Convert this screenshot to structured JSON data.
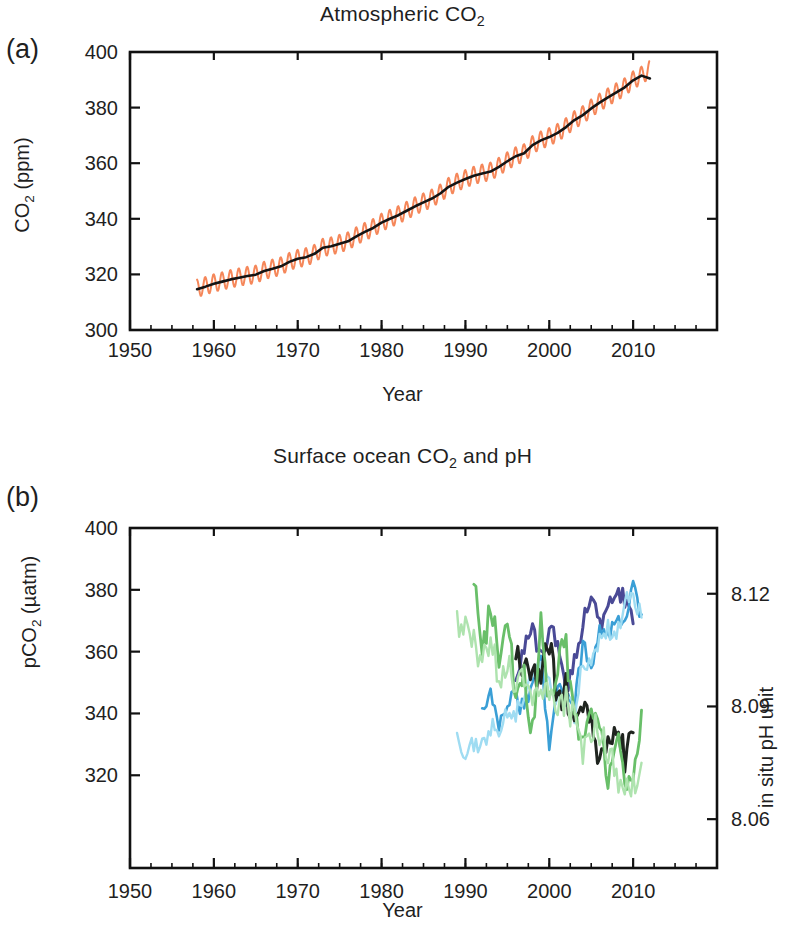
{
  "figure": {
    "width": 805,
    "height": 949,
    "background": "#ffffff"
  },
  "panel_a": {
    "letter": "(a)",
    "title_prefix": "Atmospheric CO",
    "title_sub": "2",
    "xlabel": "Year",
    "ylabel_prefix": "CO",
    "ylabel_sub": "2",
    "ylabel_suffix": " (ppm)"
  },
  "panel_b": {
    "letter": "(b)",
    "title_prefix": "Surface ocean CO",
    "title_sub": "2",
    "title_suffix": " and pH",
    "xlabel": "Year",
    "ylabel_prefix": "pCO",
    "ylabel_sub": "2",
    "ylabel_suffix": " (µatm)",
    "ylabel_right": "in situ pH unit"
  },
  "chart_data": [
    {
      "type": "line",
      "panel": "a",
      "title": "Atmospheric CO2",
      "xlabel": "Year",
      "ylabel": "CO2 (ppm)",
      "xlim": [
        1950,
        2020
      ],
      "ylim": [
        300,
        400
      ],
      "xticks": [
        1950,
        1960,
        1970,
        1980,
        1990,
        2000,
        2010
      ],
      "xticklabels": [
        "1950",
        "1960",
        "1970",
        "1980",
        "1990",
        "2000",
        "2010"
      ],
      "xminor_step": 2.5,
      "yticks": [
        300,
        320,
        340,
        360,
        380,
        400
      ],
      "yticklabels": [
        "300",
        "320",
        "340",
        "360",
        "380",
        "400"
      ],
      "grid": false,
      "legend": "none",
      "series": [
        {
          "name": "Mauna Loa monthly CO2 (seasonal cycle)",
          "color": "#f5875a",
          "linewidth": 2.0,
          "note": "monthly values with ~6 ppm peak-to-peak seasonal oscillation about the trend",
          "seasonal_amplitude_ppm": 3.2,
          "x": [
            1958,
            1959,
            1960,
            1961,
            1962,
            1963,
            1964,
            1965,
            1966,
            1967,
            1968,
            1969,
            1970,
            1971,
            1972,
            1973,
            1974,
            1975,
            1976,
            1977,
            1978,
            1979,
            1980,
            1981,
            1982,
            1983,
            1984,
            1985,
            1986,
            1987,
            1988,
            1989,
            1990,
            1991,
            1992,
            1993,
            1994,
            1995,
            1996,
            1997,
            1998,
            1999,
            2000,
            2001,
            2002,
            2003,
            2004,
            2005,
            2006,
            2007,
            2008,
            2009,
            2010,
            2011,
            2012
          ],
          "values": [
            315.0,
            315.9,
            316.9,
            317.6,
            318.4,
            319.0,
            319.6,
            320.0,
            321.4,
            322.2,
            323.0,
            324.6,
            325.7,
            326.3,
            327.5,
            329.7,
            330.2,
            331.1,
            332.0,
            333.8,
            335.4,
            336.8,
            338.7,
            340.1,
            341.4,
            343.0,
            344.6,
            346.0,
            347.4,
            349.2,
            351.6,
            353.1,
            354.4,
            355.6,
            356.4,
            357.1,
            358.8,
            360.8,
            362.6,
            363.7,
            366.6,
            368.3,
            369.5,
            371.0,
            373.1,
            375.6,
            377.4,
            379.8,
            381.9,
            383.8,
            385.6,
            387.4,
            389.9,
            391.6,
            393.8
          ]
        },
        {
          "name": "Mauna Loa deseasonalized trend CO2",
          "color": "#141414",
          "linewidth": 2.6,
          "x": [
            1958,
            1959,
            1960,
            1961,
            1962,
            1963,
            1964,
            1965,
            1966,
            1967,
            1968,
            1969,
            1970,
            1971,
            1972,
            1973,
            1974,
            1975,
            1976,
            1977,
            1978,
            1979,
            1980,
            1981,
            1982,
            1983,
            1984,
            1985,
            1986,
            1987,
            1988,
            1989,
            1990,
            1991,
            1992,
            1993,
            1994,
            1995,
            1996,
            1997,
            1998,
            1999,
            2000,
            2001,
            2002,
            2003,
            2004,
            2005,
            2006,
            2007,
            2008,
            2009,
            2010,
            2011,
            2012
          ],
          "values": [
            314.7,
            315.6,
            316.6,
            317.4,
            318.2,
            318.8,
            319.4,
            319.9,
            321.2,
            322.0,
            322.9,
            324.5,
            325.6,
            326.2,
            327.4,
            329.6,
            330.1,
            331.0,
            331.9,
            333.7,
            335.3,
            336.7,
            338.6,
            340.0,
            341.3,
            342.9,
            344.5,
            345.9,
            347.3,
            349.1,
            351.5,
            353.0,
            354.3,
            355.5,
            356.3,
            357.0,
            358.7,
            360.7,
            362.5,
            363.6,
            366.5,
            368.2,
            369.4,
            370.9,
            373.0,
            375.5,
            377.3,
            379.7,
            381.8,
            383.7,
            385.5,
            387.3,
            389.8,
            391.5,
            390.5
          ]
        }
      ]
    },
    {
      "type": "line",
      "panel": "b",
      "title": "Surface ocean CO2 and pH",
      "xlabel": "Year",
      "ylabel": "pCO2 (µatm)",
      "ylabel_right": "in situ pH unit",
      "xlim": [
        1950,
        2020
      ],
      "ylim": [
        290,
        400
      ],
      "ylim_right": [
        8.047,
        8.1375
      ],
      "xticks": [
        1950,
        1960,
        1970,
        1980,
        1990,
        2000,
        2010
      ],
      "xticklabels": [
        "1950",
        "1960",
        "1970",
        "1980",
        "1990",
        "2000",
        "2010"
      ],
      "xminor_step": 2.5,
      "yticks": [
        320,
        340,
        360,
        380,
        400
      ],
      "yticklabels": [
        "320",
        "340",
        "360",
        "380",
        "400"
      ],
      "yticks_right": [
        8.06,
        8.09,
        8.12
      ],
      "yticklabels_right": [
        "8.06",
        "8.09",
        "8.12"
      ],
      "grid": false,
      "legend": "none",
      "series": [
        {
          "name": "pCO2 station dark blue",
          "axis": "left",
          "color": "#4a4a96",
          "linewidth": 3.0,
          "x": [
            1996,
            1997,
            1998,
            1999,
            2000,
            2001,
            2002,
            2003,
            2004,
            2005,
            2006,
            2007,
            2008,
            2009,
            2010
          ],
          "values": [
            352,
            362,
            366,
            358,
            368,
            362,
            347,
            358,
            369,
            380,
            368,
            373,
            379,
            377,
            369
          ]
        },
        {
          "name": "pCO2 station medium blue",
          "axis": "left",
          "color": "#3a9fd6",
          "linewidth": 2.6,
          "x": [
            1992,
            1993,
            1994,
            1995,
            1996,
            1997,
            1998,
            1999,
            2000,
            2001,
            2002,
            2003,
            2004,
            2005,
            2006,
            2007,
            2008,
            2009,
            2010,
            2011
          ],
          "values": [
            341,
            346,
            337,
            344,
            345,
            341,
            352,
            357,
            330,
            351,
            344,
            343,
            362,
            356,
            366,
            364,
            370,
            369,
            381,
            372
          ]
        },
        {
          "name": "pCO2 station pale cyan",
          "axis": "left",
          "color": "#9fdcf2",
          "linewidth": 2.4,
          "x": [
            1989,
            1990,
            1991,
            1992,
            1993,
            1994,
            1995,
            1996,
            1997,
            1998,
            1999,
            2000,
            2001,
            2002,
            2003,
            2004,
            2005,
            2006,
            2007,
            2008,
            2009,
            2010,
            2011
          ],
          "values": [
            331,
            327,
            330,
            329,
            336,
            333,
            341,
            339,
            347,
            352,
            354,
            352,
            343,
            349,
            338,
            358,
            356,
            363,
            368,
            364,
            376,
            379,
            371
          ]
        },
        {
          "name": "pH station dark",
          "axis": "right",
          "color": "#1f241f",
          "linewidth": 3.0,
          "x": [
            1996,
            1997,
            1998,
            1999,
            2000,
            2001,
            2002,
            2003,
            2004,
            2005,
            2006,
            2007,
            2008,
            2009,
            2010
          ],
          "values": [
            8.105,
            8.099,
            8.1,
            8.098,
            8.108,
            8.09,
            8.095,
            8.083,
            8.093,
            8.086,
            8.076,
            8.079,
            8.086,
            8.077,
            8.083
          ]
        },
        {
          "name": "pH station medium green",
          "axis": "right",
          "color": "#69bf69",
          "linewidth": 2.8,
          "x": [
            1991,
            1992,
            1993,
            1994,
            1995,
            1996,
            1997,
            1998,
            1999,
            2000,
            2001,
            2002,
            2003,
            2004,
            2005,
            2006,
            2007,
            2008,
            2009,
            2010,
            2011
          ],
          "values": [
            8.122,
            8.105,
            8.117,
            8.103,
            8.113,
            8.094,
            8.097,
            8.083,
            8.113,
            8.091,
            8.102,
            8.105,
            8.089,
            8.082,
            8.088,
            8.086,
            8.072,
            8.082,
            8.071,
            8.071,
            8.089
          ]
        },
        {
          "name": "pH station pale green",
          "axis": "right",
          "color": "#aee3ae",
          "linewidth": 2.4,
          "x": [
            1989,
            1990,
            1991,
            1992,
            1993,
            1994,
            1995,
            1996,
            1997,
            1998,
            1999,
            2000,
            2001,
            2002,
            2003,
            2004,
            2005,
            2006,
            2007,
            2008,
            2009,
            2010,
            2011
          ],
          "values": [
            8.112,
            8.11,
            8.107,
            8.1,
            8.108,
            8.096,
            8.102,
            8.093,
            8.098,
            8.089,
            8.096,
            8.094,
            8.088,
            8.092,
            8.086,
            8.079,
            8.084,
            8.083,
            8.078,
            8.072,
            8.07,
            8.068,
            8.075
          ]
        }
      ]
    }
  ]
}
